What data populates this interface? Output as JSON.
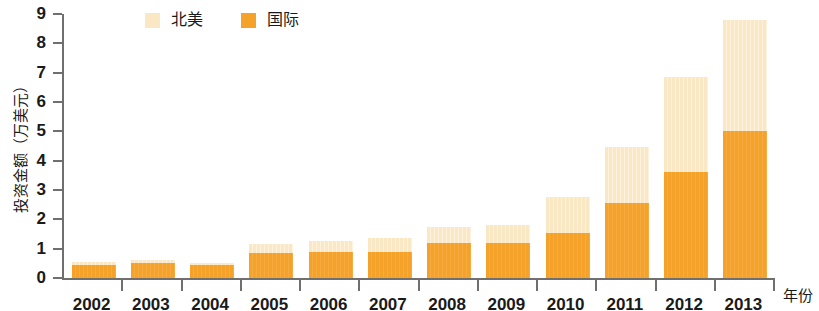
{
  "chart_data": {
    "type": "bar",
    "stacked": true,
    "title": "",
    "subtitle": "",
    "xlabel": "年份",
    "ylabel": "投资金额（万美元）",
    "categories": [
      "2002",
      "2003",
      "2004",
      "2005",
      "2006",
      "2007",
      "2008",
      "2009",
      "2010",
      "2011",
      "2012",
      "2013"
    ],
    "series": [
      {
        "name": "国际",
        "color": "#F5A22B",
        "values": [
          0.45,
          0.5,
          0.45,
          0.85,
          0.9,
          0.9,
          1.2,
          1.2,
          1.55,
          2.55,
          3.6,
          5.0
        ]
      },
      {
        "name": "北美",
        "color": "#FAE7C3",
        "values": [
          0.1,
          0.1,
          0.05,
          0.3,
          0.35,
          0.45,
          0.55,
          0.6,
          1.2,
          1.9,
          3.25,
          3.8
        ]
      }
    ],
    "totals": [
      0.55,
      0.6,
      0.5,
      1.15,
      1.25,
      1.35,
      1.75,
      1.8,
      2.75,
      4.45,
      6.85,
      8.8
    ],
    "ylim": [
      0,
      9
    ],
    "ytick_labels": [
      "0",
      "1",
      "2",
      "3",
      "4",
      "5",
      "6",
      "7",
      "8",
      "9"
    ],
    "grid": false,
    "legend_position": "top-left"
  },
  "legend": {
    "items": [
      {
        "label": "北美",
        "color": "#FAE7C3"
      },
      {
        "label": "国际",
        "color": "#F5A22B"
      }
    ]
  },
  "axes": {
    "y_title": "投资金额（万美元）",
    "x_title": "年份"
  }
}
